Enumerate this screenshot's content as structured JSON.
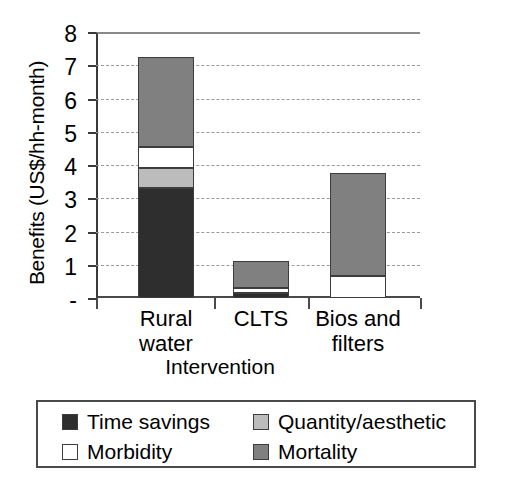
{
  "chart_data": {
    "type": "bar",
    "subtype": "stacked-vertical",
    "title": "",
    "xlabel": "Intervention",
    "ylabel": "Benefits (US$/hh-month)",
    "ylim": [
      0,
      8
    ],
    "ytick_labels": [
      "8",
      "7",
      "6",
      "5",
      "4",
      "3",
      "2",
      "1",
      "-"
    ],
    "ytick_values": [
      8,
      7,
      6,
      5,
      4,
      3,
      2,
      1,
      0
    ],
    "grid": "horizontal-dashed",
    "legend_position": "below-plot",
    "categories": [
      "Rural water",
      "CLTS",
      "Bios and filters"
    ],
    "series": [
      {
        "name": "Time savings",
        "color": "#2e2e2e",
        "values": [
          3.3,
          0.15,
          0.0
        ]
      },
      {
        "name": "Quantity/aesthetic",
        "color": "#bcbcbc",
        "values": [
          0.6,
          0.0,
          0.0
        ]
      },
      {
        "name": "Morbidity",
        "color": "#ffffff",
        "values": [
          0.65,
          0.15,
          0.66
        ]
      },
      {
        "name": "Mortality",
        "color": "#808080",
        "values": [
          2.7,
          0.8,
          3.1
        ]
      }
    ],
    "totals": [
      7.25,
      1.1,
      3.76
    ]
  },
  "axes": {
    "y_title": "Benefits (US$/hh-month)",
    "x_title": "Intervention",
    "y_ticks": [
      {
        "label": "8",
        "value": 8
      },
      {
        "label": "7",
        "value": 7
      },
      {
        "label": "6",
        "value": 6
      },
      {
        "label": "5",
        "value": 5
      },
      {
        "label": "4",
        "value": 4
      },
      {
        "label": "3",
        "value": 3
      },
      {
        "label": "2",
        "value": 2
      },
      {
        "label": "1",
        "value": 1
      },
      {
        "label": "-",
        "value": 0
      }
    ],
    "x_categories": [
      {
        "label_line1": "Rural",
        "label_line2": "water"
      },
      {
        "label_line1": "CLTS",
        "label_line2": ""
      },
      {
        "label_line1": "Bios and",
        "label_line2": "filters"
      }
    ]
  },
  "legend": {
    "items": [
      {
        "label": "Time savings",
        "color": "#2e2e2e"
      },
      {
        "label": "Quantity/aesthetic",
        "color": "#bcbcbc"
      },
      {
        "label": "Morbidity",
        "color": "#ffffff"
      },
      {
        "label": "Mortality",
        "color": "#808080"
      }
    ]
  }
}
